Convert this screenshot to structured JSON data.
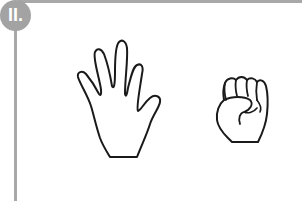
{
  "badge": {
    "label": "II."
  },
  "colors": {
    "frame": "#a8a8a8",
    "badge": "#a3a3a3",
    "outline": "#1a1a1a"
  },
  "figures": [
    {
      "name": "open-hand",
      "description": "Open palm with five fingers spread"
    },
    {
      "name": "fist",
      "description": "Closed fist"
    }
  ]
}
